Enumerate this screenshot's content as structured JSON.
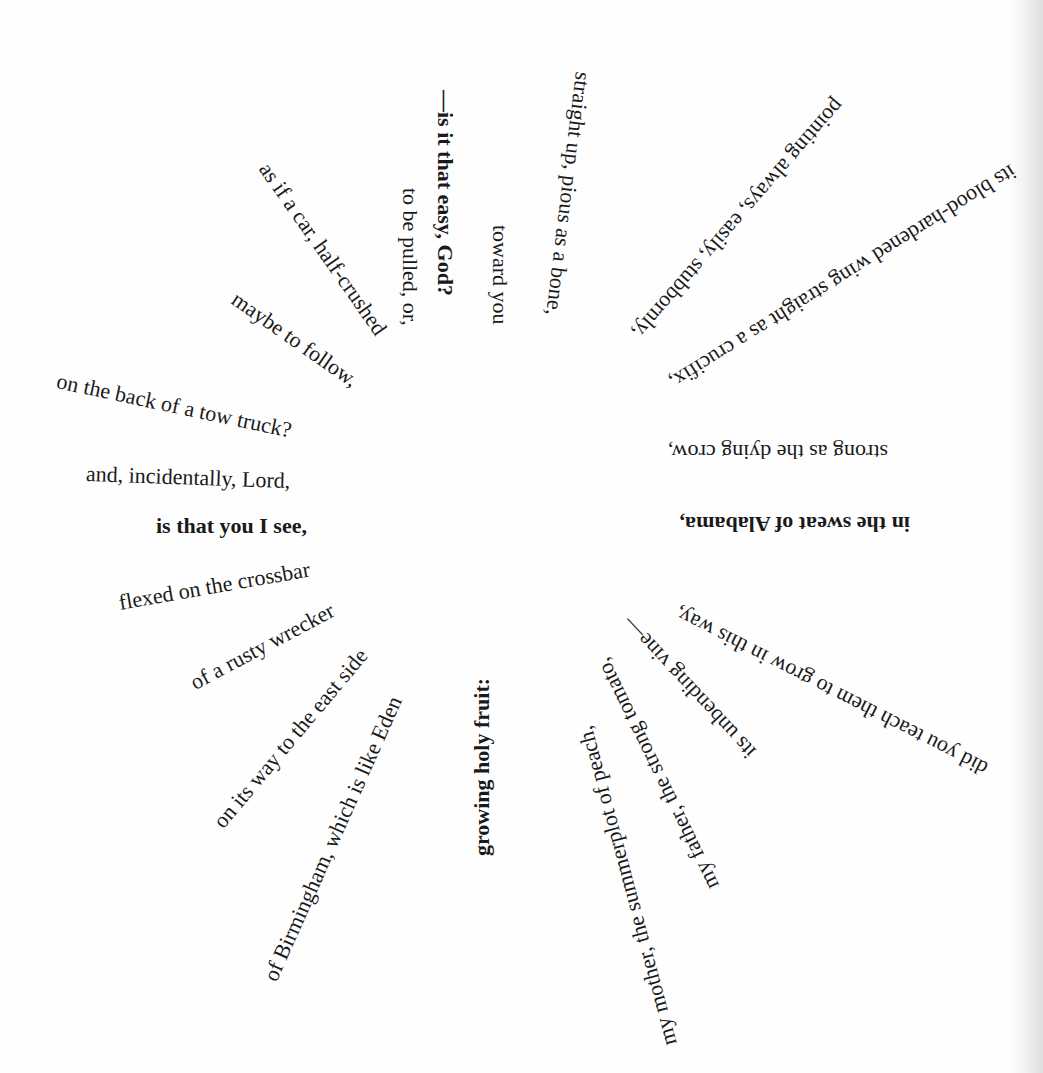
{
  "poem": {
    "layout": "radial",
    "center": [
      505,
      480
    ],
    "lines": [
      {
        "text": "—is it that easy, God?",
        "bold": true,
        "x": 445,
        "y": 90,
        "angle": 90
      },
      {
        "text": "toward you",
        "bold": false,
        "x": 500,
        "y": 225,
        "angle": 90
      },
      {
        "text": "to be pulled, or,",
        "bold": false,
        "x": 410,
        "y": 188,
        "angle": 90
      },
      {
        "text": "straight up, pious as a bone,",
        "bold": false,
        "x": 583,
        "y": 72,
        "angle": 97
      },
      {
        "text": "pointing always, easily, stubbornly,",
        "bold": false,
        "x": 840,
        "y": 102,
        "angle": 131
      },
      {
        "text": "its blood-hardened wing straight as a crucifix,",
        "bold": false,
        "x": 1014,
        "y": 170,
        "angle": 148
      },
      {
        "text": "strong as the dying crow,",
        "bold": false,
        "x": 888,
        "y": 452,
        "angle": 180
      },
      {
        "text": "in the sweat of Alabama,",
        "bold": true,
        "x": 910,
        "y": 524,
        "angle": 180
      },
      {
        "text": "did you teach them to grow in this way,",
        "bold": false,
        "x": 986,
        "y": 770,
        "angle": 207
      },
      {
        "text": "its unbending vine—",
        "bold": false,
        "x": 752,
        "y": 755,
        "angle": 227
      },
      {
        "text": "my father, the strong tomato,",
        "bold": false,
        "x": 713,
        "y": 888,
        "angle": 244
      },
      {
        "text": "my mother, the summerplot of peach,",
        "bold": false,
        "x": 670,
        "y": 1045,
        "angle": 255
      },
      {
        "text": "growing holy fruit:",
        "bold": true,
        "x": 482,
        "y": 856,
        "angle": -90
      },
      {
        "text": "of Birmingham, which is like Eden",
        "bold": false,
        "x": 270,
        "y": 980,
        "angle": -66
      },
      {
        "text": "on its way to the east side",
        "bold": false,
        "x": 218,
        "y": 825,
        "angle": -50
      },
      {
        "text": "of a rusty wrecker",
        "bold": false,
        "x": 192,
        "y": 684,
        "angle": -28
      },
      {
        "text": "flexed on the crossbar",
        "bold": false,
        "x": 119,
        "y": 603,
        "angle": -10
      },
      {
        "text": "is that you I see,",
        "bold": true,
        "x": 156,
        "y": 526,
        "angle": 0
      },
      {
        "text": "and, incidentally, Lord,",
        "bold": false,
        "x": 86,
        "y": 474,
        "angle": 2
      },
      {
        "text": "on the back of a tow truck?",
        "bold": false,
        "x": 57,
        "y": 381,
        "angle": 12
      },
      {
        "text": "maybe to follow,",
        "bold": false,
        "x": 234,
        "y": 297,
        "angle": 35
      },
      {
        "text": "as if a car, half-crushed",
        "bold": false,
        "x": 264,
        "y": 165,
        "angle": 55
      }
    ]
  }
}
